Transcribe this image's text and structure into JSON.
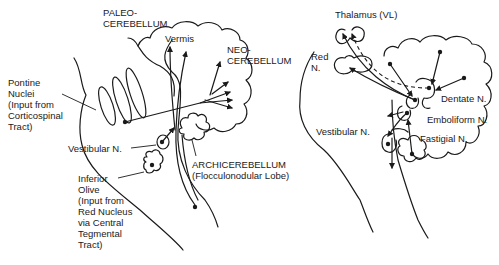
{
  "left_panel": {
    "title": "Cerebellar afferents",
    "labels": {
      "paleocerebellum": "PALEO-\nCEREBELLUM",
      "vermis": "Vermis",
      "neocerebellum": "NEO-\nCEREBELLUM",
      "pontine_nuclei": "Pontine\nNuclei\n(Input from\nCorticospinal\nTract)",
      "vestibular_n": "Vestibular N.",
      "archicerebellum": "ARCHICEREBELLUM\n(Flocculonodular Lobe)",
      "inferior_olive": "Inferior\nOlive\n(Input from\nRed Nucleus\nvia Central\nTegmental\nTract)"
    }
  },
  "right_panel": {
    "title": "Cerebellar efferents",
    "labels": {
      "thalamus": "Thalamus (VL)",
      "red_n": "Red\nN.",
      "dentate_n": "Dentate N.",
      "emboliform_n": "Emboliform N.",
      "vestibular_n": "Vestibular N.",
      "fastigial_n": "Fastigial N."
    }
  },
  "colors": {
    "ink": "#1a1a1a",
    "background": "#ffffff"
  }
}
